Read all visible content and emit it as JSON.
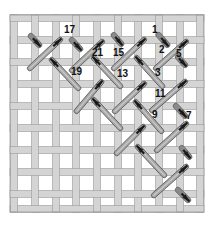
{
  "diagram": {
    "title": "",
    "canvas": {
      "x": 10,
      "y": 15,
      "width": 194,
      "height": 197,
      "vertical_threads_x": [
        14,
        35,
        56,
        76,
        97,
        118,
        138,
        159,
        180,
        200
      ],
      "horizontal_threads_y": [
        18,
        40,
        62,
        84,
        106,
        128,
        150,
        172,
        194,
        209
      ],
      "thread_width": 7,
      "colors": {
        "thread_fill": "#d4d4d4",
        "thread_edge": "#9a9a9a",
        "background": "#ffffff"
      }
    },
    "stitch_colors": {
      "long_fill": "#a8a8a8",
      "long_edge": "#555555",
      "arrow": "#1a1a1a",
      "short_fill": "#3a3a3a"
    },
    "long_stitches": [
      {
        "x1": 28,
        "y1": 70,
        "x2": 62,
        "y2": 38
      },
      {
        "x1": 70,
        "y1": 72,
        "x2": 104,
        "y2": 40
      },
      {
        "x1": 112,
        "y1": 70,
        "x2": 146,
        "y2": 38
      },
      {
        "x1": 154,
        "y1": 70,
        "x2": 188,
        "y2": 40
      },
      {
        "x1": 75,
        "y1": 113,
        "x2": 103,
        "y2": 80
      },
      {
        "x1": 113,
        "y1": 113,
        "x2": 146,
        "y2": 82
      },
      {
        "x1": 150,
        "y1": 112,
        "x2": 187,
        "y2": 80
      },
      {
        "x1": 115,
        "y1": 155,
        "x2": 145,
        "y2": 125
      },
      {
        "x1": 155,
        "y1": 152,
        "x2": 188,
        "y2": 122
      },
      {
        "x1": 152,
        "y1": 197,
        "x2": 188,
        "y2": 165
      },
      {
        "x1": 80,
        "y1": 90,
        "x2": 50,
        "y2": 58
      },
      {
        "x1": 122,
        "y1": 88,
        "x2": 92,
        "y2": 56
      },
      {
        "x1": 164,
        "y1": 88,
        "x2": 135,
        "y2": 56
      },
      {
        "x1": 122,
        "y1": 130,
        "x2": 92,
        "y2": 98
      },
      {
        "x1": 163,
        "y1": 133,
        "x2": 134,
        "y2": 100
      },
      {
        "x1": 166,
        "y1": 177,
        "x2": 136,
        "y2": 145
      }
    ],
    "short_stitches": [
      {
        "x1": 29,
        "y1": 34,
        "x2": 41,
        "y2": 47
      },
      {
        "x1": 70,
        "y1": 38,
        "x2": 82,
        "y2": 51
      },
      {
        "x1": 112,
        "y1": 33,
        "x2": 123,
        "y2": 46
      },
      {
        "x1": 157,
        "y1": 33,
        "x2": 169,
        "y2": 47
      },
      {
        "x1": 176,
        "y1": 55,
        "x2": 187,
        "y2": 67
      },
      {
        "x1": 174,
        "y1": 104,
        "x2": 187,
        "y2": 118
      },
      {
        "x1": 180,
        "y1": 146,
        "x2": 191,
        "y2": 159
      },
      {
        "x1": 176,
        "y1": 188,
        "x2": 190,
        "y2": 202
      }
    ],
    "labels": [
      {
        "text": "17",
        "x": 64,
        "y": 33
      },
      {
        "text": "1",
        "x": 152,
        "y": 33
      },
      {
        "text": "21",
        "x": 92,
        "y": 56
      },
      {
        "text": "15",
        "x": 113,
        "y": 56
      },
      {
        "text": "2",
        "x": 159,
        "y": 53
      },
      {
        "text": "5",
        "x": 176,
        "y": 57
      },
      {
        "text": "19",
        "x": 71,
        "y": 75
      },
      {
        "text": "13",
        "x": 117,
        "y": 77
      },
      {
        "text": "3",
        "x": 155,
        "y": 76
      },
      {
        "text": "11",
        "x": 155,
        "y": 97
      },
      {
        "text": "9",
        "x": 152,
        "y": 118
      },
      {
        "text": "7",
        "x": 186,
        "y": 119
      }
    ]
  }
}
